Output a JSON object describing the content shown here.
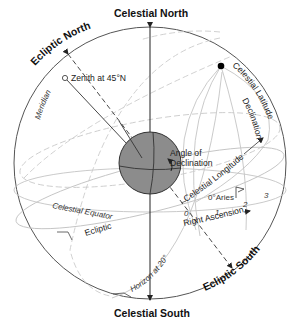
{
  "diagram": {
    "poles": {
      "celestial_north": "Celestial North",
      "celestial_south": "Celestial South",
      "ecliptic_north": "Ecliptic North",
      "ecliptic_south": "Ecliptic South"
    },
    "labels": {
      "zenith": "Zenith at 45°N",
      "meridian": "Meridian",
      "celestial_latitude": "Celestial Latitude",
      "declination": "Declination",
      "angle_of_declination_1": "Angle of",
      "angle_of_declination_2": "Declination",
      "celestial_longitude": "Celestial Longitude",
      "aries": "0°Aries",
      "zero": "0",
      "right_ascension": "Right Ascension",
      "celestial_equator": "Celestial Equator",
      "ecliptic": "Ecliptic",
      "horizon": "Horizon at 20°N"
    },
    "ra_hour_ticks": [
      "1",
      "2",
      "3"
    ],
    "colors": {
      "outline": "#555555",
      "grid_line": "#bbbbbb",
      "dashed_line": "#c8c8c8",
      "earth_fill": "#8a8a8a",
      "earth_stroke": "#333333",
      "axis": "#222222",
      "star": "#000000"
    }
  }
}
